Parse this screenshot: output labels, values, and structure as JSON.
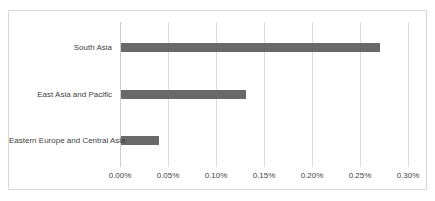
{
  "chart_data": {
    "type": "bar",
    "orientation": "horizontal",
    "title": "",
    "xlabel": "",
    "ylabel": "",
    "categories": [
      "South Asia",
      "East Asia and Pacific",
      "Eastern Europe and Central Asia"
    ],
    "values": [
      0.27,
      0.13,
      0.04
    ],
    "value_unit": "percent",
    "xlim": [
      0,
      0.3
    ],
    "x_ticks": [
      "0.00%",
      "0.05%",
      "0.10%",
      "0.15%",
      "0.20%",
      "0.25%",
      "0.30%"
    ],
    "x_tick_values": [
      0.0,
      0.05,
      0.1,
      0.15,
      0.2,
      0.25,
      0.3
    ],
    "grid": "vertical-gridlines-on",
    "legend": "none",
    "colors": {
      "bar": "#696969",
      "gridline": "#dcdcdc",
      "axis_line": "#cccccc",
      "frame_border": "#d8d8d8",
      "text": "#3f3f3f",
      "background": "#ffffff"
    }
  }
}
